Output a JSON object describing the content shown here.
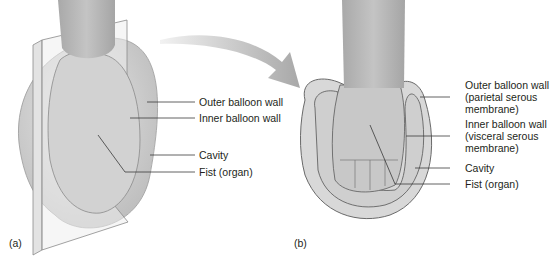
{
  "figure": {
    "panels": [
      {
        "id": "a",
        "label": "(a)",
        "callouts": [
          {
            "text": "Outer balloon wall"
          },
          {
            "text": "Inner balloon wall"
          },
          {
            "text": "Cavity"
          },
          {
            "text": "Fist (organ)"
          }
        ]
      },
      {
        "id": "b",
        "label": "(b)",
        "callouts": [
          {
            "lines": [
              "Outer balloon wall",
              "(parietal serous",
              "membrane)"
            ]
          },
          {
            "lines": [
              "Inner balloon wall",
              "(visceral serous",
              "membrane)"
            ]
          },
          {
            "text": "Cavity"
          },
          {
            "text": "Fist (organ)"
          }
        ]
      }
    ],
    "colors": {
      "balloon_fill": "#d6d6d6",
      "arm_fill": "#b9b9b9",
      "plane_fill": "#ededed",
      "line": "#3a3a3a",
      "text": "#231f20"
    }
  }
}
